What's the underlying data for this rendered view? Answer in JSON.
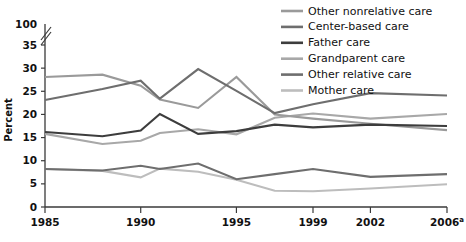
{
  "chart_data": {
    "type": "line",
    "title": "",
    "xlabel": "",
    "ylabel": "Percent",
    "x": [
      1985,
      1988,
      1990,
      1991,
      1993,
      1995,
      1997,
      1999,
      2002,
      2006
    ],
    "xtick_labels": [
      "1985",
      "1990",
      "1995",
      "1999",
      "2002",
      "2006"
    ],
    "xtick_superscript": "a",
    "xtick_values": [
      1985,
      1990,
      1995,
      1999,
      2002,
      2006
    ],
    "ytick_labels": [
      "0",
      "5",
      "10",
      "15",
      "20",
      "25",
      "30",
      "35",
      "100"
    ],
    "ytick_values": [
      0,
      5,
      10,
      15,
      20,
      25,
      30,
      35,
      100
    ],
    "ylim": [
      0,
      37
    ],
    "axis_break": true,
    "grid": false,
    "legend_position": "top-right",
    "series": [
      {
        "name": "Other nonrelative care",
        "color": "#9a9a9a",
        "values": [
          28.1,
          28.6,
          26.2,
          23.2,
          21.4,
          28.1,
          20.0,
          19.1,
          18.0,
          16.6
        ]
      },
      {
        "name": "Center-based care",
        "color": "#6e6e6e",
        "values": [
          23.1,
          25.5,
          27.3,
          23.4,
          29.8,
          25.1,
          20.3,
          22.2,
          24.6,
          24.1
        ]
      },
      {
        "name": "Father care",
        "color": "#3d3d3d",
        "values": [
          16.2,
          15.3,
          16.5,
          20.1,
          15.8,
          16.4,
          17.8,
          17.2,
          17.8,
          17.5
        ]
      },
      {
        "name": "Grandparent care",
        "color": "#a8a8a8",
        "values": [
          15.8,
          13.6,
          14.3,
          16.0,
          16.8,
          15.7,
          19.3,
          20.2,
          19.1,
          20.1
        ]
      },
      {
        "name": "Other relative care",
        "color": "#6e6e6e",
        "values": [
          8.2,
          7.9,
          8.9,
          8.2,
          9.4,
          6.0,
          7.1,
          8.2,
          6.5,
          7.1
        ]
      },
      {
        "name": "Mother care",
        "color": "#bdbdbd",
        "values": [
          8.2,
          7.8,
          6.4,
          8.3,
          7.6,
          5.9,
          3.5,
          3.4,
          4.0,
          4.9
        ]
      }
    ]
  },
  "legend": {
    "items": [
      {
        "label": "Other nonrelative care",
        "color": "#9a9a9a"
      },
      {
        "label": "Center-based care",
        "color": "#6e6e6e"
      },
      {
        "label": "Father care",
        "color": "#3d3d3d"
      },
      {
        "label": "Grandparent care",
        "color": "#a8a8a8"
      },
      {
        "label": "Other relative care",
        "color": "#6e6e6e"
      },
      {
        "label": "Mother care",
        "color": "#bdbdbd"
      }
    ]
  }
}
